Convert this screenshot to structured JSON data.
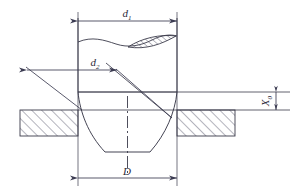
{
  "figure": {
    "colors": {
      "line": "#3a3a4a",
      "hatch": "#44445a",
      "dimension": "#3c3c52",
      "background": "#ffffff",
      "label": "#2b2b3a"
    },
    "labels": {
      "drill_diameter": "d",
      "drill_diameter_sub": "1",
      "drill_diameter_full": "d₁",
      "inner_diameter": "d",
      "inner_diameter_sub": "2",
      "inner_diameter_full": "d₂",
      "bottom_diameter": "D",
      "offset": "X",
      "offset_sub": "0",
      "offset_full": "X₀"
    },
    "elements": {
      "top_dimension_name": "drill shank outer diameter dimension",
      "mid_dimension_name": "web/point diameter dimension with leader",
      "bottom_dimension_name": "drill point flat width dimension",
      "right_dimension_name": "plate exit offset dimension",
      "plate_left_name": "workpiece plate left section",
      "plate_right_name": "workpiece plate right section",
      "drill_body_name": "twist drill body outline",
      "break_symbol_name": "conventional break with flute hatching",
      "centerline_name": "drill axis centerline"
    }
  }
}
